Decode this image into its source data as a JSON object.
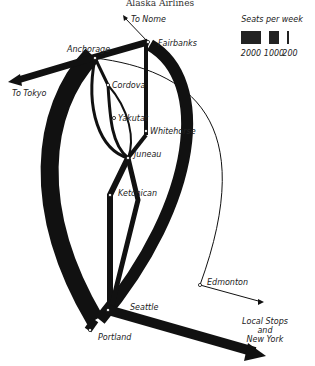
{
  "title": "Alaska Airlines",
  "legend": {
    "title": "Seats per week",
    "items": [
      {
        "label": "2000",
        "width": 20
      },
      {
        "label": "1000",
        "width": 10
      },
      {
        "label": "200",
        "width": 2
      }
    ]
  },
  "cities": {
    "anchorage": "Anchorage",
    "fairbanks": "Fairbanks",
    "cordova": "Cordova",
    "yakutat": "Yakutat",
    "whitehorse": "Whitehorse",
    "juneau": "Juneau",
    "ketchican": "Ketchican",
    "seattle": "Seattle",
    "portland": "Portland",
    "edmonton": "Edmonton"
  },
  "destinations": {
    "nome": "To Nome",
    "tokyo": "To Tokyo",
    "ny_line1": "Local Stops",
    "ny_line2": "and",
    "ny_line3": "New York"
  },
  "colors": {
    "route": "#111111",
    "text": "#222222"
  }
}
